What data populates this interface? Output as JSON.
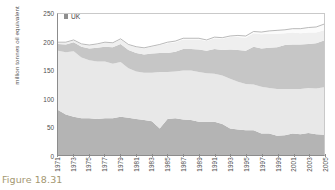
{
  "caption": "Figure 18.31",
  "legend": {
    "marker_name": "uk-series-marker",
    "label": "UK"
  },
  "axes": {
    "ylabel": "million tonnes oil equivalent",
    "yticks": [
      "0",
      "50",
      "100",
      "150",
      "200",
      "250"
    ],
    "xticks": [
      "1971",
      "1973",
      "1975",
      "1977",
      "1979",
      "1981",
      "1983",
      "1985",
      "1987",
      "1989",
      "1991",
      "1993",
      "1995",
      "1997",
      "1999",
      "2001",
      "2003",
      "2005"
    ]
  },
  "colors": {
    "band_coal": "#b4b4b4",
    "band_oil": "#e8e8e8",
    "band_gas": "#c6c6c6",
    "band_nuclear": "#efefef",
    "band_renewables": "#fbfbfb",
    "axis": "#8c8c8c",
    "caption": "#a39770"
  },
  "chart_data": {
    "type": "area",
    "title": "",
    "subtitle": "",
    "xlabel": "",
    "ylabel": "million tonnes oil equivalent",
    "ylim": [
      0,
      250
    ],
    "xlim": [
      1971,
      2005
    ],
    "grid": false,
    "legend_position": "top-left",
    "stacked": true,
    "x": [
      1971,
      1972,
      1973,
      1974,
      1975,
      1976,
      1977,
      1978,
      1979,
      1980,
      1981,
      1982,
      1983,
      1984,
      1985,
      1986,
      1987,
      1988,
      1989,
      1990,
      1991,
      1992,
      1993,
      1994,
      1995,
      1996,
      1997,
      1998,
      1999,
      2000,
      2001,
      2002,
      2003,
      2004,
      2005
    ],
    "series": [
      {
        "name": "Coal",
        "values": [
          80,
          72,
          68,
          65,
          65,
          64,
          65,
          65,
          68,
          66,
          64,
          62,
          60,
          47,
          64,
          65,
          63,
          62,
          59,
          59,
          59,
          55,
          47,
          45,
          44,
          44,
          38,
          38,
          34,
          35,
          38,
          37,
          39,
          37,
          36
        ]
      },
      {
        "name": "Oil",
        "values": [
          105,
          110,
          116,
          108,
          103,
          102,
          101,
          97,
          97,
          88,
          84,
          84,
          86,
          100,
          83,
          83,
          87,
          88,
          88,
          86,
          85,
          86,
          88,
          85,
          82,
          81,
          83,
          81,
          83,
          82,
          79,
          80,
          80,
          81,
          84
        ]
      },
      {
        "name": "Gas",
        "values": [
          12,
          14,
          16,
          19,
          21,
          24,
          26,
          29,
          32,
          32,
          33,
          32,
          34,
          34,
          34,
          35,
          38,
          38,
          40,
          40,
          44,
          45,
          52,
          56,
          59,
          67,
          68,
          71,
          74,
          78,
          79,
          79,
          78,
          80,
          83
        ]
      },
      {
        "name": "Nuclear",
        "values": [
          2,
          3,
          3,
          4,
          5,
          6,
          7,
          7,
          8,
          9,
          10,
          11,
          12,
          14,
          17,
          17,
          17,
          17,
          18,
          17,
          19,
          20,
          22,
          23,
          23,
          24,
          25,
          25,
          24,
          21,
          21,
          20,
          20,
          19,
          18
        ]
      },
      {
        "name": "Renewables and other",
        "values": [
          1,
          1,
          1,
          1,
          1,
          1,
          1,
          1,
          1,
          1,
          1,
          1,
          1,
          1,
          2,
          2,
          2,
          2,
          2,
          2,
          2,
          2,
          2,
          3,
          3,
          3,
          4,
          5,
          6,
          6,
          7,
          8,
          9,
          10,
          11
        ]
      }
    ],
    "totals": [
      200,
      200,
      204,
      197,
      195,
      197,
      200,
      199,
      206,
      196,
      192,
      190,
      193,
      196,
      200,
      202,
      207,
      207,
      207,
      204,
      209,
      208,
      211,
      212,
      211,
      219,
      218,
      220,
      221,
      222,
      224,
      224,
      226,
      227,
      232
    ]
  }
}
